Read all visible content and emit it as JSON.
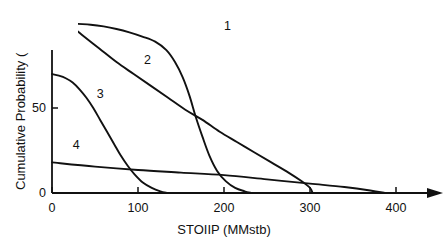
{
  "chart_data": {
    "type": "line",
    "title": "",
    "subtitle": "",
    "xlabel": "STOIIP (MMstb)",
    "ylabel": "Cumulative Probability (",
    "xlim": [
      0,
      430
    ],
    "ylim": [
      0,
      105
    ],
    "xticks": [
      0,
      100,
      200,
      300,
      400
    ],
    "xtick_labels": [
      "0",
      "100",
      "200",
      "300",
      "400"
    ],
    "yticks": [
      0,
      50
    ],
    "ytick_labels": [
      "0",
      "50"
    ],
    "grid": false,
    "legend": "inline-curve-labels",
    "x_axis_arrow": true,
    "series": [
      {
        "name": "1",
        "label": "1",
        "label_x": 200,
        "label_y": 98,
        "points": [
          [
            18,
            100
          ],
          [
            30,
            99.5
          ],
          [
            45,
            99
          ],
          [
            60,
            98
          ],
          [
            75,
            96.5
          ],
          [
            90,
            94.5
          ],
          [
            105,
            92
          ],
          [
            120,
            89
          ],
          [
            133,
            84
          ],
          [
            143,
            77
          ],
          [
            152,
            68
          ],
          [
            160,
            57
          ],
          [
            167,
            45
          ],
          [
            175,
            33
          ],
          [
            183,
            22
          ],
          [
            192,
            13
          ],
          [
            202,
            7
          ],
          [
            213,
            3
          ],
          [
            224,
            1
          ],
          [
            232,
            0
          ]
        ]
      },
      {
        "name": "2",
        "label": "2",
        "label_x": 107,
        "label_y": 78,
        "points": [
          [
            18,
            100
          ],
          [
            35,
            93
          ],
          [
            55,
            85
          ],
          [
            75,
            77
          ],
          [
            95,
            70
          ],
          [
            115,
            63
          ],
          [
            135,
            56
          ],
          [
            155,
            49
          ],
          [
            175,
            43
          ],
          [
            195,
            36
          ],
          [
            215,
            30
          ],
          [
            235,
            24
          ],
          [
            255,
            18
          ],
          [
            275,
            12
          ],
          [
            290,
            7
          ],
          [
            300,
            3
          ],
          [
            303,
            0
          ]
        ]
      },
      {
        "name": "3",
        "label": "3",
        "label_x": 52,
        "label_y": 58,
        "points": [
          [
            0,
            70
          ],
          [
            8,
            69
          ],
          [
            16,
            67.5
          ],
          [
            24,
            65
          ],
          [
            32,
            61
          ],
          [
            40,
            56
          ],
          [
            48,
            50
          ],
          [
            56,
            43
          ],
          [
            64,
            36
          ],
          [
            72,
            29
          ],
          [
            80,
            22
          ],
          [
            88,
            16
          ],
          [
            96,
            11
          ],
          [
            106,
            6
          ],
          [
            116,
            3
          ],
          [
            126,
            1
          ],
          [
            134,
            0
          ]
        ]
      },
      {
        "name": "4",
        "label": "4",
        "label_x": 24,
        "label_y": 28,
        "points": [
          [
            0,
            18
          ],
          [
            50,
            15.5
          ],
          [
            100,
            13.5
          ],
          [
            150,
            12
          ],
          [
            200,
            10.5
          ],
          [
            250,
            8
          ],
          [
            300,
            5.5
          ],
          [
            340,
            3.5
          ],
          [
            370,
            1.5
          ],
          [
            387,
            0
          ]
        ]
      }
    ],
    "colors": {
      "axis": "#111111",
      "curve": "#111111",
      "background": "#ffffff"
    }
  }
}
